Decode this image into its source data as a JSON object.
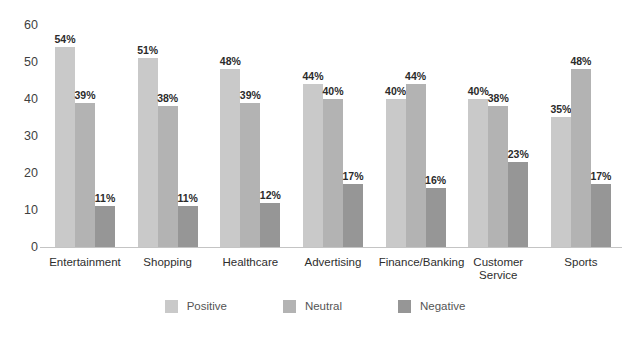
{
  "chart_data": {
    "type": "bar",
    "title": "",
    "subtitle": "",
    "xlabel": "",
    "ylabel": "",
    "ylim": [
      0,
      60
    ],
    "yticks": [
      0,
      10,
      20,
      30,
      40,
      50,
      60
    ],
    "ytick_labels": [
      "0",
      "10",
      "20",
      "30",
      "40",
      "50",
      "60"
    ],
    "grid": false,
    "legend_position": "bottom",
    "value_suffix": "%",
    "categories": [
      "Entertainment",
      "Shopping",
      "Healthcare",
      "Advertising",
      "Finance/Banking",
      "Customer Service",
      "Sports"
    ],
    "series": [
      {
        "name": "Positive",
        "color": "#c9c9c9",
        "values": [
          54,
          51,
          48,
          44,
          40,
          40,
          35
        ],
        "labels": [
          "54%",
          "51%",
          "48%",
          "44%",
          "40%",
          "40%",
          "35%"
        ]
      },
      {
        "name": "Neutral",
        "color": "#b3b3b3",
        "values": [
          39,
          38,
          39,
          40,
          44,
          38,
          48
        ],
        "labels": [
          "39%",
          "38%",
          "39%",
          "40%",
          "44%",
          "38%",
          "48%"
        ]
      },
      {
        "name": "Negative",
        "color": "#969696",
        "values": [
          11,
          11,
          12,
          17,
          16,
          23,
          17
        ],
        "labels": [
          "11%",
          "11%",
          "12%",
          "17%",
          "16%",
          "23%",
          "17%"
        ]
      }
    ]
  },
  "axis": {
    "tick_0": "0",
    "tick_10": "10",
    "tick_20": "20",
    "tick_30": "30",
    "tick_40": "40",
    "tick_50": "50",
    "tick_60": "60"
  },
  "legend": {
    "items": [
      {
        "label": "Positive",
        "color": "#c9c9c9"
      },
      {
        "label": "Neutral",
        "color": "#b3b3b3"
      },
      {
        "label": "Negative",
        "color": "#969696"
      }
    ]
  },
  "colors": {
    "positive": "#c9c9c9",
    "neutral": "#b3b3b3",
    "negative": "#969696",
    "axis_line": "#c4c4c4",
    "tick_text": "#3f3f3f",
    "category_text": "#2e2e2e",
    "value_text": "#2b2b2b",
    "legend_text": "#555555",
    "background": "#ffffff"
  }
}
